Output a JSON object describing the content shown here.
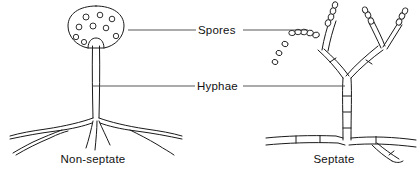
{
  "figure": {
    "width": 417,
    "height": 176,
    "background_color": "#ffffff",
    "ink_color": "#1a1a1a",
    "leader_color": "#3a3a3a"
  },
  "callouts": [
    {
      "id": "spores",
      "label": "Spores",
      "text_x": 208,
      "text_y": 34,
      "leader_y": 30,
      "left_line": {
        "x1": 128,
        "x2": 196
      },
      "right_line": {
        "x1": 243,
        "x2": 308
      }
    },
    {
      "id": "hyphae",
      "label": "Hyphae",
      "text_x": 207,
      "text_y": 90,
      "leader_y": 86,
      "left_line": {
        "x1": 92,
        "x2": 195
      },
      "right_line": {
        "x1": 243,
        "x2": 345
      }
    }
  ],
  "captions": [
    {
      "id": "non-septate",
      "label": "Non-septate",
      "x": 93,
      "y": 163
    },
    {
      "id": "septate",
      "label": "Septate",
      "x": 334,
      "y": 163
    }
  ],
  "left_organism": {
    "name": "non-septate-fungus",
    "description": "Sporangium on an aseptate sporangiophore with rhizoids",
    "sporangium": {
      "center_x": 96,
      "center_y": 27,
      "radius_x": 28,
      "radius_y": 21,
      "spore_count": 9,
      "spores": [
        {
          "cx": 86,
          "cy": 17,
          "r": 3.0
        },
        {
          "cx": 100,
          "cy": 15,
          "r": 2.8
        },
        {
          "cx": 112,
          "cy": 19,
          "r": 2.8
        },
        {
          "cx": 79,
          "cy": 27,
          "r": 2.9
        },
        {
          "cx": 93,
          "cy": 26,
          "r": 3.0
        },
        {
          "cx": 106,
          "cy": 28,
          "r": 2.8
        },
        {
          "cx": 76,
          "cy": 37,
          "r": 2.7
        },
        {
          "cx": 84,
          "cy": 42,
          "r": 2.6
        },
        {
          "cx": 116,
          "cy": 36,
          "r": 2.7
        }
      ]
    },
    "stalk": {
      "top_y": 42,
      "bottom_y": 120,
      "x": 96,
      "width": 7,
      "septate": false
    },
    "rhizoid_count": 6
  },
  "right_organism": {
    "name": "septate-fungus",
    "description": "Branched septate hypha bearing chains of conidia",
    "stalk": {
      "top_y": 78,
      "bottom_y": 140,
      "x": 347,
      "width": 8,
      "septate": true,
      "septa_y": [
        96,
        112,
        128
      ]
    },
    "basal_hypha": {
      "y": 142,
      "x1": 268,
      "x2": 415,
      "septa_x": [
        300,
        322,
        372
      ]
    },
    "branch_count": 3,
    "spore_chains": [
      {
        "id": "chain-left",
        "spore_count": 5,
        "direction": "left"
      },
      {
        "id": "chain-upper-middle",
        "spore_count": 5,
        "direction": "up"
      },
      {
        "id": "chain-right-inner",
        "spore_count": 4,
        "direction": "up"
      },
      {
        "id": "chain-right-outer",
        "spore_count": 4,
        "direction": "up-right"
      }
    ],
    "free_spores": [
      {
        "cx": 293,
        "cy": 44,
        "r": 2.6
      },
      {
        "cx": 288,
        "cy": 53,
        "r": 2.5
      },
      {
        "cx": 284,
        "cy": 62,
        "r": 2.4
      }
    ]
  }
}
